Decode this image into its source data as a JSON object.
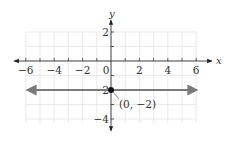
{
  "chart_data": {
    "type": "line",
    "title": "",
    "xlabel": "x",
    "ylabel": "y",
    "xlim": [
      -6,
      6
    ],
    "ylim": [
      -4,
      2
    ],
    "grid": true,
    "x_ticks": [
      -6,
      -4,
      -2,
      0,
      2,
      4,
      6
    ],
    "x_tick_labels": [
      "−6",
      "−4",
      "−2",
      "0",
      "2",
      "4",
      "6"
    ],
    "y_ticks": [
      2,
      -2,
      -4
    ],
    "y_tick_labels": [
      "2",
      "−2",
      "−4"
    ],
    "series": [
      {
        "name": "y = -2",
        "equation": "y = -2",
        "x": [
          -6,
          6
        ],
        "y": [
          -2,
          -2
        ],
        "arrows": "both",
        "color": "#7a7a7a"
      }
    ],
    "points": [
      {
        "x": 0,
        "y": -2,
        "label": "(0, −2)",
        "color": "#111111"
      }
    ],
    "annotations": [
      {
        "text": "(0, −2)",
        "x": 0,
        "y": -2,
        "leader_line": true
      }
    ]
  },
  "colors": {
    "axis": "#333333",
    "grid": "#e3e3e3",
    "line": "#7a7a7a",
    "point": "#111111",
    "background": "#ffffff"
  }
}
